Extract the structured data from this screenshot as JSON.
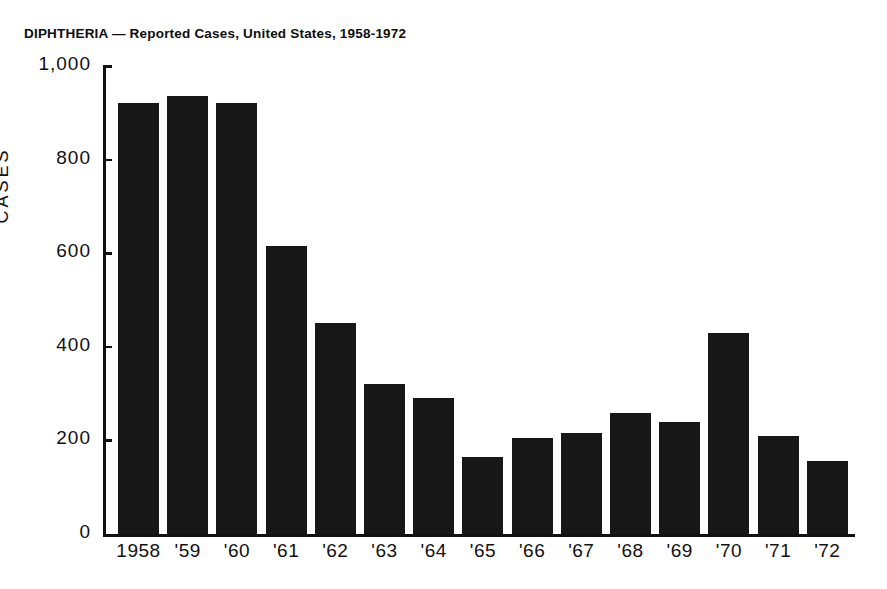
{
  "chart_data": {
    "type": "bar",
    "title": "DIPHTHERIA — Reported Cases, United States, 1958-1972",
    "xlabel": "",
    "ylabel": "CASES",
    "categories": [
      "1958",
      "'59",
      "'60",
      "'61",
      "'62",
      "'63",
      "'64",
      "'65",
      "'66",
      "'67",
      "'68",
      "'69",
      "'70",
      "'71",
      "'72"
    ],
    "values": [
      920,
      935,
      920,
      615,
      450,
      320,
      290,
      165,
      205,
      215,
      258,
      240,
      430,
      210,
      155
    ],
    "ylim": [
      0,
      1000
    ],
    "yticks": [
      0,
      200,
      400,
      600,
      800,
      1000
    ],
    "ytick_labels": [
      "0",
      "200",
      "400",
      "600",
      "800",
      "1,000"
    ],
    "grid": false,
    "legend": false,
    "legend_position": "none",
    "bar_color": "#171717",
    "axis_color": "#111111",
    "background_color": "#ffffff",
    "series": [
      {
        "name": "Reported Cases",
        "values": [
          920,
          935,
          920,
          615,
          450,
          320,
          290,
          165,
          205,
          215,
          258,
          240,
          430,
          210,
          155
        ]
      }
    ]
  }
}
